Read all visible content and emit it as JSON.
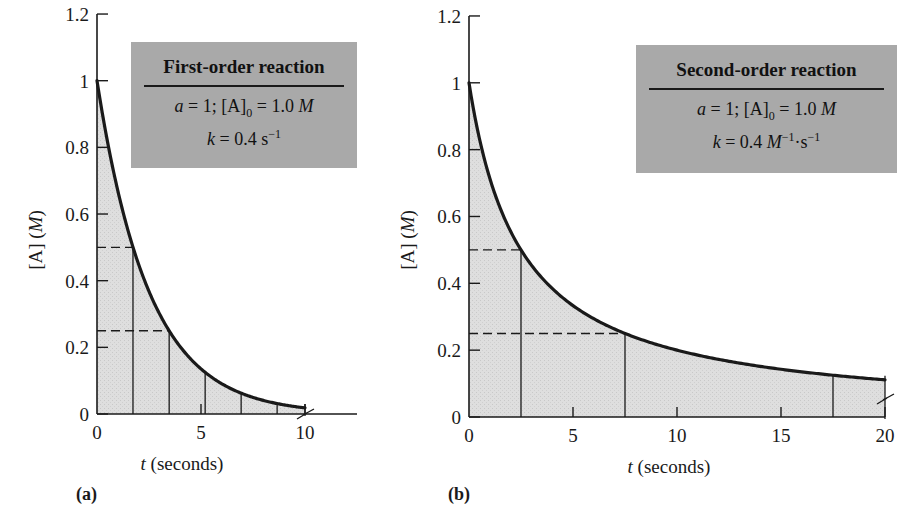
{
  "chart_data": [
    {
      "id": "a",
      "panel_label": "(a)",
      "type": "area",
      "title": "First-order reaction",
      "box": {
        "title": "First-order reaction",
        "line1": {
          "a": "a",
          "eq1": " = 1;  [A]",
          "sub": "0",
          "eq2": " = 1.0 ",
          "unit": "M"
        },
        "line2": {
          "k": "k",
          "eq": " = 0.4 s",
          "sup": "−1"
        }
      },
      "params": {
        "a": 1,
        "A0": 1.0,
        "k": 0.4,
        "k_units": "s^-1",
        "order": 1
      },
      "equation": "[A] = [A]0 * exp(-k t)",
      "xlabel_var": "t",
      "xlabel_rest": " (seconds)",
      "ylabel_main": "[A] ",
      "ylabel_unit": "(M)",
      "xlim": [
        0,
        10
      ],
      "ylim": [
        0,
        1.2
      ],
      "xticks": [
        0,
        5,
        10
      ],
      "xtick_labels": [
        "0",
        "5",
        "10"
      ],
      "yticks": [
        0,
        0.2,
        0.4,
        0.6,
        0.8,
        1,
        1.2
      ],
      "ytick_labels": [
        "0",
        "0.2",
        "0.4",
        "0.6",
        "0.8",
        "1",
        "1.2"
      ],
      "x": [
        0,
        1,
        2,
        3,
        4,
        5,
        6,
        7,
        8,
        9,
        10
      ],
      "values": [
        1.0,
        0.67,
        0.449,
        0.301,
        0.202,
        0.135,
        0.091,
        0.061,
        0.041,
        0.027,
        0.018
      ],
      "half_life_lines_t": [
        1.73,
        3.47,
        5.2,
        6.93,
        8.66
      ],
      "dashed_levels": [
        0.5,
        0.25
      ],
      "axis_break_at_x": 10,
      "grid": false,
      "legend": "none"
    },
    {
      "id": "b",
      "panel_label": "(b)",
      "type": "area",
      "title": "Second-order reaction",
      "box": {
        "title": "Second-order reaction",
        "line1": {
          "a": "a",
          "eq1": " = 1;  [A]",
          "sub": "0",
          "eq2": " = 1.0 ",
          "unit": "M"
        },
        "line2": {
          "k": "k",
          "eq": " = 0.4 ",
          "unit": "M",
          "sup1": "−1",
          "mid": "·s",
          "sup2": "−1"
        }
      },
      "params": {
        "a": 1,
        "A0": 1.0,
        "k": 0.4,
        "k_units": "M^-1·s^-1",
        "order": 2
      },
      "equation": "1/[A] = 1/[A]0 + k t",
      "xlabel_var": "t",
      "xlabel_rest": " (seconds)",
      "ylabel_main": "[A] ",
      "ylabel_unit": "(M)",
      "xlim": [
        0,
        20
      ],
      "ylim": [
        0,
        1.2
      ],
      "xticks": [
        0,
        5,
        10,
        15,
        20
      ],
      "xtick_labels": [
        "0",
        "5",
        "10",
        "15",
        "20"
      ],
      "yticks": [
        0,
        0.2,
        0.4,
        0.6,
        0.8,
        1,
        1.2
      ],
      "ytick_labels": [
        "0",
        "0.2",
        "0.4",
        "0.6",
        "0.8",
        "1",
        "1.2"
      ],
      "x": [
        0,
        2.5,
        5,
        7.5,
        10,
        12.5,
        15,
        17.5,
        20
      ],
      "values": [
        1.0,
        0.5,
        0.333,
        0.25,
        0.2,
        0.167,
        0.143,
        0.125,
        0.111
      ],
      "half_life_lines_t": [
        2.5,
        7.5,
        17.5
      ],
      "dashed_levels": [
        0.5,
        0.25
      ],
      "axis_break_at_x": 20,
      "grid": false,
      "legend": "none"
    }
  ],
  "colors": {
    "fill": "#dcdcdc",
    "box": "#a9a9a9",
    "ink": "#1a1a1a"
  }
}
